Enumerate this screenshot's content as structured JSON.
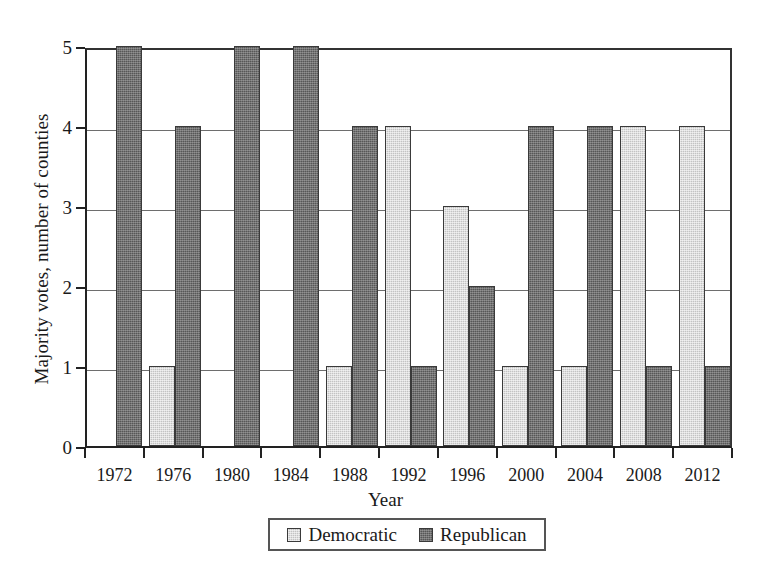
{
  "chart_data": {
    "type": "bar",
    "title": "",
    "xlabel": "Year",
    "ylabel": "Majority votes, number of counties",
    "categories": [
      "1972",
      "1976",
      "1980",
      "1984",
      "1988",
      "1992",
      "1996",
      "2000",
      "2004",
      "2008",
      "2012"
    ],
    "series": [
      {
        "name": "Democratic",
        "color": "#c3c3c3",
        "values": [
          0,
          1,
          0,
          0,
          1,
          4,
          3,
          1,
          1,
          4,
          4
        ]
      },
      {
        "name": "Republican",
        "color": "#575757",
        "values": [
          5,
          4,
          5,
          5,
          4,
          1,
          2,
          4,
          4,
          1,
          1
        ]
      }
    ],
    "ylim": [
      0,
      5
    ],
    "yticks": [
      "0",
      "1",
      "2",
      "3",
      "4",
      "5"
    ],
    "grid": true,
    "legend_position": "bottom-center"
  },
  "legend": {
    "entries": [
      {
        "label": "Democratic"
      },
      {
        "label": "Republican"
      }
    ]
  },
  "axis": {
    "y_title": "Majority votes, number of counties",
    "x_title": "Year"
  }
}
